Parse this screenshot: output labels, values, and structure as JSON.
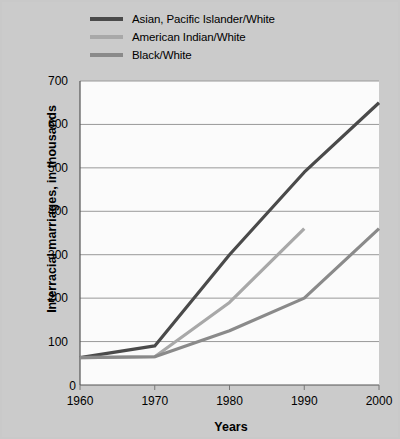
{
  "chart_data": {
    "type": "line",
    "title": "",
    "xlabel": "Years",
    "ylabel": "Interracial marriages, in thousands",
    "x": [
      1960,
      1970,
      1980,
      1990,
      2000
    ],
    "xlim": [
      1960,
      2000
    ],
    "ylim": [
      0,
      700
    ],
    "xticks": [
      "1960",
      "1970",
      "1980",
      "1990",
      "2000"
    ],
    "yticks": [
      "100",
      "200",
      "300",
      "400",
      "500",
      "600",
      "700"
    ],
    "zero_tick": "0",
    "grid": "horizontal",
    "legend_position": "top-left",
    "series": [
      {
        "name": "Asian, Pacific Islander/White",
        "color": "#4a4a4a",
        "x": [
          1960,
          1970,
          1980,
          1990,
          2000
        ],
        "values": [
          63,
          90,
          300,
          490,
          650
        ]
      },
      {
        "name": "American Indian/White",
        "color": "#a8a8a8",
        "x": [
          1960,
          1970,
          1980,
          1990
        ],
        "values": [
          63,
          65,
          190,
          360
        ]
      },
      {
        "name": "Black/White",
        "color": "#8a8a8a",
        "x": [
          1960,
          1970,
          1980,
          1990,
          2000
        ],
        "values": [
          63,
          65,
          125,
          200,
          360
        ]
      }
    ]
  },
  "legend": {
    "items": [
      {
        "label": "Asian, Pacific Islander/White",
        "color": "#4a4a4a"
      },
      {
        "label": "American Indian/White",
        "color": "#a8a8a8"
      },
      {
        "label": "Black/White",
        "color": "#8a8a8a"
      }
    ]
  },
  "axes": {
    "y_label": "Interracial marriages, in thousands",
    "x_label": "Years",
    "y_ticks": [
      "700",
      "600",
      "500",
      "400",
      "300",
      "200",
      "100"
    ],
    "zero": "0",
    "x_ticks": [
      "1960",
      "1970",
      "1980",
      "1990",
      "2000"
    ]
  },
  "colors": {
    "background": "#c9c9c9",
    "plot_background": "#fbfbfb",
    "grid": "#9a9a9a",
    "axis": "#555555"
  }
}
